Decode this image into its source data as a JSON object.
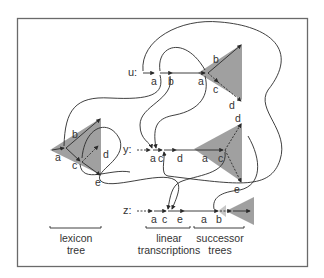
{
  "colors": {
    "frame": "#6a6a6a",
    "ink": "#2a2a2a",
    "tree_fill": "#8f8f8f",
    "text": "#333333",
    "background": "#ffffff"
  },
  "rows": {
    "u": {
      "label": "u:",
      "linear": [
        "a",
        "b"
      ],
      "tree": {
        "root": "a",
        "children": [
          "b",
          "c",
          "d"
        ]
      }
    },
    "y": {
      "label": "y:",
      "linear": [
        "a",
        "c",
        "d"
      ],
      "tree": {
        "root": "a",
        "children": [
          "c",
          "d",
          "e"
        ]
      }
    },
    "z": {
      "label": "z:",
      "linear": [
        "a",
        "c",
        "e"
      ],
      "tree": {
        "root": "a",
        "children": [
          "b"
        ]
      }
    }
  },
  "lexicon_tree": {
    "nodes": [
      "a",
      "b",
      "c",
      "d",
      "e"
    ]
  },
  "captions": {
    "lexicon": [
      "lexicon",
      "tree"
    ],
    "linear": [
      "linear",
      "transcriptions"
    ],
    "successor": [
      "successor",
      "trees"
    ]
  }
}
